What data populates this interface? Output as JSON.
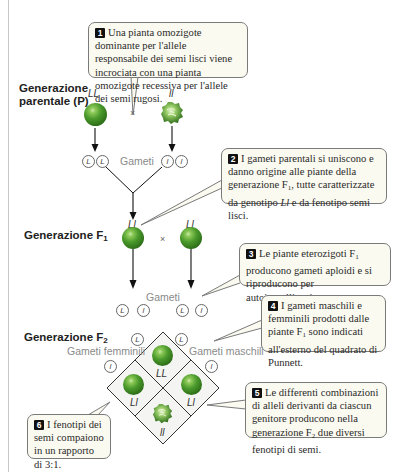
{
  "generations": {
    "parental_line1": "Generazione",
    "parental_line2": "parentale (P)",
    "f1": "Generazione F",
    "f1_sub": "1",
    "f2": "Generazione F",
    "f2_sub": "2"
  },
  "parental": {
    "left_genotype": "LL",
    "right_genotype": "ll",
    "cross_symbol": "×",
    "gametes_label": "Gameti",
    "left_gametes": [
      "L",
      "L"
    ],
    "right_gametes": [
      "l",
      "l"
    ]
  },
  "f1": {
    "left_genotype": "Ll",
    "right_genotype": "Ll",
    "cross_symbol": "×",
    "gametes_label": "Gameti",
    "gametes": [
      "L",
      "l",
      "L",
      "l"
    ]
  },
  "f2": {
    "female_label": "Gameti femminili",
    "male_label": "Gameti maschili",
    "female_gametes": [
      "L",
      "l"
    ],
    "male_gametes": [
      "L",
      "l"
    ],
    "cells": [
      {
        "position": "top",
        "genotype": "LL",
        "phenotype": "smooth"
      },
      {
        "position": "left",
        "genotype": "Ll",
        "phenotype": "smooth"
      },
      {
        "position": "right",
        "genotype": "Ll",
        "phenotype": "smooth"
      },
      {
        "position": "bottom",
        "genotype": "ll",
        "phenotype": "wrinkled"
      }
    ]
  },
  "callouts": [
    {
      "n": "1",
      "text": "Una pianta omozigote dominante per l'allele responsabile dei semi lisci viene incrociata con una pianta omozigote recessiva per l'allele dei semi rugosi."
    },
    {
      "n": "2",
      "text_a": "I gameti parentali si uniscono e danno origine alle piante della generazione F",
      "sub": "1",
      "text_b": ", tutte caratterizzate da genotipo ",
      "italic": "Ll",
      "text_c": " e da fenotipo semi lisci."
    },
    {
      "n": "3",
      "text_a": "Le piante eterozigoti F",
      "sub": "1",
      "text_b": " producono gameti aploidi e si riproducono per autoimpollinazione."
    },
    {
      "n": "4",
      "text_a": "I gameti maschili e femminili prodotti dalle piante F",
      "sub": "1",
      "text_b": " sono indicati all'esterno del quadrato di Punnett."
    },
    {
      "n": "5",
      "text_a": "Le differenti combinazioni di alleli derivanti da ciascun genitore producono nella generazione F",
      "sub": "2",
      "text_b": " due diversi fenotipi di semi."
    },
    {
      "n": "6",
      "text": "I fenotipi dei semi compaiono in un rapporto di 3:1."
    }
  ],
  "colors": {
    "pea_green": "#3f8a24",
    "callout_fill": "#fbfaf1",
    "callout_border": "#7a7a7a",
    "line": "#111111"
  }
}
